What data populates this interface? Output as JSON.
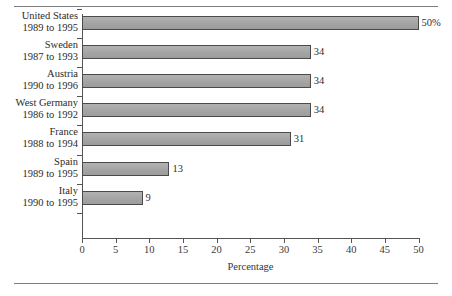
{
  "chart_data": {
    "type": "bar",
    "orientation": "horizontal",
    "title": "",
    "xlabel": "Percentage",
    "ylabel": "",
    "xlim": [
      0,
      50
    ],
    "xticks": [
      0,
      5,
      10,
      15,
      20,
      25,
      30,
      35,
      40,
      45,
      50
    ],
    "grid": false,
    "legend": false,
    "bar_color": "#a9a9a9",
    "bar_border_color": "#4a4a4a",
    "categories": [
      "United States",
      "Sweden",
      "Austria",
      "West Germany",
      "France",
      "Spain",
      "Italy"
    ],
    "category_sublabels": [
      "1989 to 1995",
      "1987 to 1993",
      "1990 to 1996",
      "1986 to 1992",
      "1988 to 1994",
      "1989 to 1995",
      "1990 to 1995"
    ],
    "values": [
      50,
      34,
      34,
      34,
      31,
      13,
      9
    ],
    "value_labels": [
      "50%",
      "34",
      "34",
      "34",
      "31",
      "13",
      "9"
    ]
  },
  "rules": {
    "top": "",
    "bottom": ""
  }
}
